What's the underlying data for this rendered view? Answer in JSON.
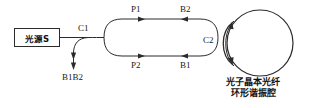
{
  "figure": {
    "source_box": {
      "label": "光源S"
    },
    "couplers": {
      "c1": "C1",
      "c2": "C2"
    },
    "paths": {
      "top_forward": "P1",
      "top_backward": "B2",
      "bottom_forward": "P2",
      "bottom_backward": "B1"
    },
    "output": {
      "label": "B1B2"
    },
    "resonator_caption": {
      "line1": "光子晶本光纤",
      "line2": "环形谐振腔"
    },
    "colors": {
      "line": "#2b2b2b",
      "text": "#111111",
      "background": "#ffffff"
    }
  }
}
